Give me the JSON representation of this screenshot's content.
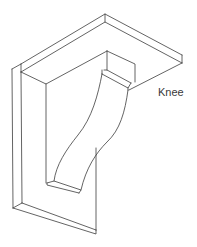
{
  "diagram": {
    "labels": [
      {
        "text": "Knee",
        "x": 158,
        "y": 87
      }
    ],
    "stroke_color": "#3c3c3c",
    "background": "#ffffff"
  }
}
